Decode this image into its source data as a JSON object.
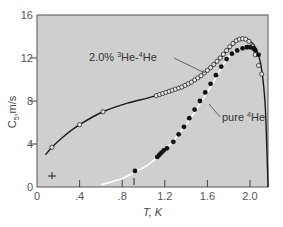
{
  "chart_data": {
    "type": "scatter",
    "title": "",
    "xlabel": "T, K",
    "ylabel": "C5,m/s",
    "ylabel_main": "C",
    "ylabel_sub": "5",
    "ylabel_unit": ",m/s",
    "xlim": [
      0,
      2.17
    ],
    "ylim": [
      0,
      16
    ],
    "x_ticks": [
      0,
      0.4,
      0.8,
      1.2,
      1.6,
      2.0
    ],
    "x_tick_labels": [
      "0",
      ".4",
      ".8",
      "1.2",
      "1.6",
      "2.0"
    ],
    "y_ticks": [
      0,
      4,
      8,
      12,
      16
    ],
    "y_tick_labels": [
      "0",
      "4",
      "8",
      "12",
      "16"
    ],
    "grid": false,
    "legend": "none (inline annotations)",
    "annotations": [
      {
        "text_prefix": "2.0% ",
        "sup1": "3",
        "mid": "He-",
        "sup2": "4",
        "suffix": "He",
        "x": 0.75,
        "y": 12.5,
        "points_to": [
          1.55,
          9.6
        ]
      },
      {
        "text_prefix": "pure ",
        "sup1": "4",
        "suffix": "He",
        "x": 1.75,
        "y": 6.0,
        "points_to": [
          1.6,
          6.9
        ]
      }
    ],
    "series": [
      {
        "name": "2.0% 3He-4He",
        "marker": "open-circle",
        "line": "solid black",
        "x": [
          0.14,
          0.4,
          0.62,
          1.12,
          1.15,
          1.18,
          1.21,
          1.24,
          1.27,
          1.3,
          1.33,
          1.36,
          1.39,
          1.42,
          1.45,
          1.48,
          1.51,
          1.54,
          1.57,
          1.6,
          1.63,
          1.66,
          1.69,
          1.72,
          1.75,
          1.78,
          1.81,
          1.84,
          1.87,
          1.9,
          1.93,
          1.96,
          1.99,
          2.02,
          2.05,
          2.08,
          2.11
        ],
        "y": [
          3.7,
          5.8,
          7.0,
          8.5,
          8.6,
          8.7,
          8.8,
          8.9,
          9.0,
          9.1,
          9.2,
          9.3,
          9.45,
          9.6,
          9.75,
          9.95,
          10.15,
          10.35,
          10.6,
          10.85,
          11.1,
          11.4,
          11.7,
          12.0,
          12.35,
          12.7,
          13.05,
          13.35,
          13.6,
          13.75,
          13.8,
          13.75,
          13.55,
          13.1,
          12.3,
          11.3,
          10.5
        ]
      },
      {
        "name": "pure 4He",
        "marker": "filled-circle",
        "line": "white (calculated)",
        "x": [
          0.92,
          1.13,
          1.15,
          1.17,
          1.19,
          1.22,
          1.28,
          1.33,
          1.38,
          1.43,
          1.48,
          1.53,
          1.58,
          1.63,
          1.68,
          1.73,
          1.78,
          1.83,
          1.88,
          1.93,
          1.97,
          2.0,
          2.03,
          2.05,
          2.08
        ],
        "y": [
          1.5,
          2.8,
          3.0,
          3.2,
          3.4,
          3.6,
          4.2,
          4.9,
          5.6,
          6.4,
          7.2,
          8.0,
          8.8,
          9.6,
          10.4,
          11.2,
          11.9,
          12.4,
          12.7,
          12.9,
          13.0,
          13.0,
          12.9,
          12.7,
          12.3
        ]
      }
    ],
    "curves": {
      "mixture_fit": [
        [
          0.08,
          3.0
        ],
        [
          0.14,
          3.7
        ],
        [
          0.25,
          4.7
        ],
        [
          0.4,
          5.8
        ],
        [
          0.62,
          7.0
        ],
        [
          0.85,
          7.8
        ],
        [
          1.12,
          8.5
        ],
        [
          1.4,
          9.5
        ],
        [
          1.6,
          10.8
        ],
        [
          1.78,
          12.6
        ],
        [
          1.88,
          13.7
        ],
        [
          1.94,
          13.85
        ],
        [
          2.0,
          13.6
        ],
        [
          2.05,
          13.0
        ],
        [
          2.1,
          11.5
        ],
        [
          2.14,
          8.0
        ],
        [
          2.16,
          3.0
        ],
        [
          2.17,
          0
        ]
      ],
      "pure_fit": [
        [
          0.6,
          0.2
        ],
        [
          0.8,
          0.8
        ],
        [
          0.92,
          1.4
        ],
        [
          1.05,
          2.1
        ],
        [
          1.2,
          3.4
        ],
        [
          1.4,
          5.8
        ],
        [
          1.6,
          8.8
        ],
        [
          1.8,
          12.1
        ],
        [
          1.95,
          13.0
        ],
        [
          2.05,
          12.7
        ]
      ]
    }
  }
}
